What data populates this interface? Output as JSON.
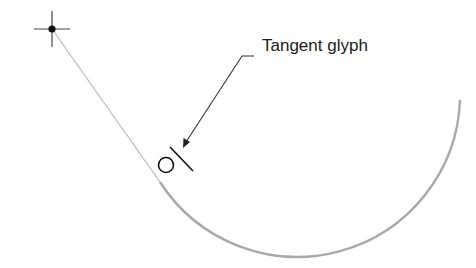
{
  "diagram": {
    "annotation": {
      "text": "Tangent glyph"
    },
    "colors": {
      "line": "#b0b0b0",
      "arc": "#a8a8a8",
      "glyph": "#111111",
      "leader": "#333333",
      "text": "#1a1a1a"
    },
    "elements": {
      "start_point": {
        "x": 52,
        "y": 29,
        "icon": "crosshair-point-icon"
      },
      "tangent_line": {
        "from": [
          52,
          29
        ],
        "to": [
          160,
          182
        ]
      },
      "arc": {
        "center": [
          297,
          93
        ],
        "radius": 163,
        "from": [
          160,
          182
        ],
        "to": [
          460,
          100
        ]
      },
      "tangent_glyph": {
        "icon": "tangent-glyph-icon",
        "x": 170,
        "y": 160
      },
      "leader": {
        "from": [
          240,
          60
        ],
        "elbow": [
          230,
          60
        ],
        "to": [
          186,
          143
        ]
      }
    }
  }
}
